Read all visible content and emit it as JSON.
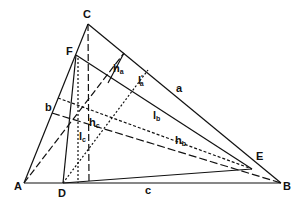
{
  "diagram": {
    "title": "",
    "vertices": {
      "A": {
        "label": "A",
        "x": 24,
        "y": 183,
        "lx": 14,
        "ly": 190
      },
      "B": {
        "label": "B",
        "x": 281,
        "y": 183,
        "lx": 283,
        "ly": 190
      },
      "C": {
        "label": "C",
        "x": 88,
        "y": 24,
        "lx": 83,
        "ly": 18
      },
      "D": {
        "label": "D",
        "x": 63,
        "y": 183,
        "lx": 58,
        "ly": 197
      },
      "E": {
        "label": "E",
        "x": 252,
        "y": 169,
        "lx": 256,
        "ly": 160
      },
      "F": {
        "label": "F",
        "x": 76,
        "y": 55,
        "lx": 66,
        "ly": 55
      }
    },
    "side_labels": {
      "a": {
        "text": "a",
        "x": 176,
        "y": 92
      },
      "b": {
        "text": "b",
        "x": 45,
        "y": 111
      },
      "c": {
        "text": "c",
        "x": 145,
        "y": 194
      }
    },
    "segment_labels": [
      {
        "main": "h",
        "sub": "a",
        "prime": "",
        "x": 113,
        "y": 72
      },
      {
        "main": "l",
        "sub": "a",
        "prime": "′",
        "x": 138,
        "y": 84
      },
      {
        "main": "h",
        "sub": "c",
        "prime": "",
        "x": 89,
        "y": 126
      },
      {
        "main": "l",
        "sub": "c",
        "prime": "",
        "x": 79,
        "y": 140
      },
      {
        "main": "l",
        "sub": "b",
        "prime": "",
        "x": 153,
        "y": 119
      },
      {
        "main": "h",
        "sub": "b",
        "prime": "",
        "x": 175,
        "y": 144
      }
    ],
    "colors": {
      "stroke": "#111111",
      "background": "#ffffff"
    }
  }
}
